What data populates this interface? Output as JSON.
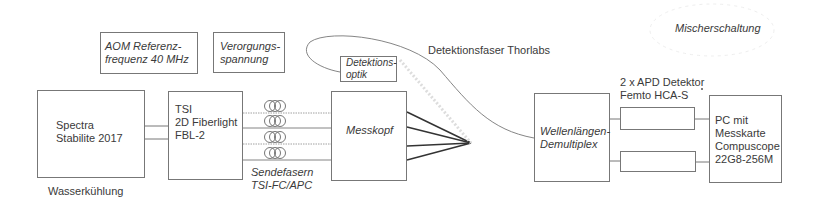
{
  "diagram": {
    "title_annotation": "Mischerschaltung",
    "nodes": {
      "aom": {
        "label": "AOM Referenz-\nfrequenz 40 MHz"
      },
      "versorgung": {
        "label": "Verorgungs-\nspannung"
      },
      "laser": {
        "label": "Spectra\nStabilite 2017",
        "caption": "Wasserkühlung"
      },
      "tsi": {
        "label": "TSI\n2D Fiberlight\nFBL-2"
      },
      "detektionsoptik": {
        "label": "Detektions-\noptik"
      },
      "messkopf": {
        "label": "Messkopf"
      },
      "demux": {
        "label": "Wellenlängen-\nDemultiplex"
      },
      "apd1": {
        "label": ""
      },
      "apd2": {
        "label": ""
      },
      "pc": {
        "label": "PC mit\nMesskarte\nCompuscope\n22G8-256M"
      }
    },
    "edge_labels": {
      "sendefasern": "Sendefasern\nTSI-FC/APC",
      "detektionsfaser": "Detektionsfaser Thorlabs",
      "apd": "2 x APD Detektor\nFemto HCA-S"
    },
    "edges": [
      {
        "from": "laser",
        "to": "tsi",
        "count": 2
      },
      {
        "from": "tsi",
        "to": "messkopf",
        "count": 4,
        "label": "sendefasern",
        "coils": true
      },
      {
        "from": "messkopf",
        "to": "focus-point",
        "count": 4
      },
      {
        "from": "detektionsoptik",
        "to": "demux",
        "label": "detektionsfaser",
        "style": "curve"
      },
      {
        "from": "demux",
        "to": "apd1"
      },
      {
        "from": "demux",
        "to": "apd2"
      },
      {
        "from": "apd1",
        "to": "pc"
      },
      {
        "from": "apd2",
        "to": "pc"
      }
    ],
    "colors": {
      "line": "#777777",
      "thick_line": "#333333",
      "text": "#3a3a3a"
    }
  }
}
